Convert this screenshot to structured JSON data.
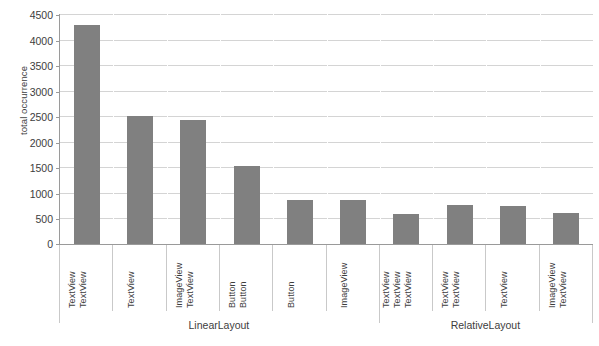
{
  "chart_data": {
    "type": "bar",
    "title": "",
    "xlabel": "",
    "ylabel": "total occurrence",
    "ylim": [
      0,
      4500
    ],
    "ytick_step": 500,
    "ytick_labels": [
      "0",
      "500",
      "1000",
      "1500",
      "2000",
      "2500",
      "3000",
      "3500",
      "4000",
      "4500"
    ],
    "ytick_values": [
      0,
      500,
      1000,
      1500,
      2000,
      2500,
      3000,
      3500,
      4000,
      4500
    ],
    "grid": true,
    "legend": false,
    "bar_color": "#808080",
    "axis_color": "#9a9a9a",
    "grid_color": "#d4d4d4",
    "categories": [
      "TextView TextView",
      "TextView",
      "ImageView TextView",
      "Button Button",
      "Button",
      "ImageView",
      "TextView TextView TextView",
      "TextView TextView",
      "TextView",
      "ImageView TextView"
    ],
    "category_lines": [
      [
        "TextView",
        "TextView"
      ],
      [
        "TextView"
      ],
      [
        "ImageView",
        "TextView"
      ],
      [
        "Button",
        "Button"
      ],
      [
        "Button"
      ],
      [
        "ImageView"
      ],
      [
        "TextView",
        "TextView",
        "TextView"
      ],
      [
        "TextView",
        "TextView"
      ],
      [
        "TextView"
      ],
      [
        "ImageView",
        "TextView"
      ]
    ],
    "values": [
      4280,
      2500,
      2420,
      1520,
      860,
      860,
      580,
      760,
      750,
      600
    ],
    "groups": [
      {
        "label": "LinearLayout",
        "categories": 6
      },
      {
        "label": "RelativeLayout",
        "categories": 4
      }
    ]
  }
}
